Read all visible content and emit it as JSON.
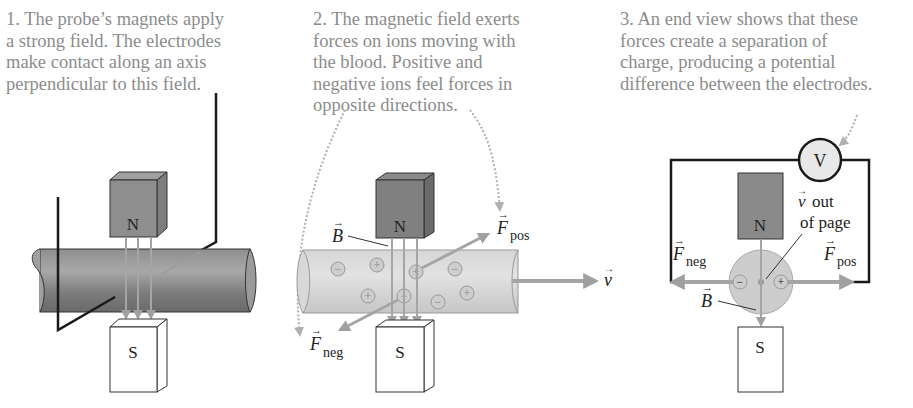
{
  "figure": {
    "panels": [
      {
        "caption": "1. The probe’s magnets apply\na strong field. The electrodes\nmake contact along an axis\nperpendicular to this field.",
        "magnet_north_label": "N",
        "magnet_south_label": "S"
      },
      {
        "caption": "2. The magnetic field exerts\nforces on ions moving with\nthe blood. Positive and\nnegative ions feel forces in\nopposite directions.",
        "magnet_north_label": "N",
        "magnet_south_label": "S",
        "field_label": "B",
        "force_pos_label": "F",
        "force_pos_sub": "pos",
        "force_neg_label": "F",
        "force_neg_sub": "neg",
        "velocity_label": "v",
        "positive_ion_symbol": "+",
        "negative_ion_symbol": "−"
      },
      {
        "caption": "3. An end view shows that these\nforces create a separation of\ncharge, producing a potential\ndifference between the electrodes.",
        "magnet_north_label": "N",
        "magnet_south_label": "S",
        "voltmeter_label": "V",
        "velocity_label": "v",
        "velocity_note_line1": "out",
        "velocity_note_line2": "of page",
        "field_label": "B",
        "force_pos_label": "F",
        "force_pos_sub": "pos",
        "force_neg_label": "F",
        "force_neg_sub": "neg"
      }
    ],
    "colors": {
      "caption_text": "#8c8c8c",
      "magnet_north": "#8a8a8a",
      "magnet_south": "#ffffff",
      "vessel_dark": "#7a7a7a",
      "vessel_light": "#cfcfcf",
      "arrow": "#a5a5a5",
      "wire": "#1a1a1a"
    }
  }
}
